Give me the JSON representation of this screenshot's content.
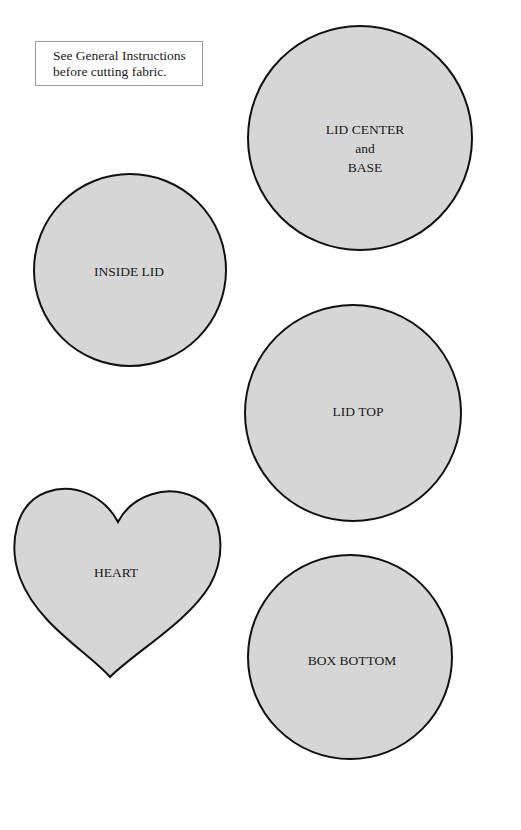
{
  "note": {
    "line1": "See General Instructions",
    "line2": "before cutting fabric."
  },
  "colors": {
    "shape_fill": "#d6d6d6",
    "shape_stroke": "#111111",
    "note_border": "#9a9a9a"
  },
  "patterns": [
    {
      "id": "lid-center-base",
      "shape": "circle",
      "label_lines": [
        "LID CENTER",
        "and",
        "BASE"
      ],
      "cx": 360,
      "cy": 138,
      "r": 112
    },
    {
      "id": "inside-lid",
      "shape": "circle",
      "label_lines": [
        "INSIDE LID"
      ],
      "cx": 130,
      "cy": 270,
      "r": 96
    },
    {
      "id": "lid-top",
      "shape": "circle",
      "label_lines": [
        "LID TOP"
      ],
      "cx": 353,
      "cy": 413,
      "r": 108
    },
    {
      "id": "heart",
      "shape": "heart",
      "label_lines": [
        "HEART"
      ]
    },
    {
      "id": "box-bottom",
      "shape": "circle",
      "label_lines": [
        "BOX BOTTOM"
      ],
      "cx": 350,
      "cy": 657,
      "r": 102
    }
  ]
}
